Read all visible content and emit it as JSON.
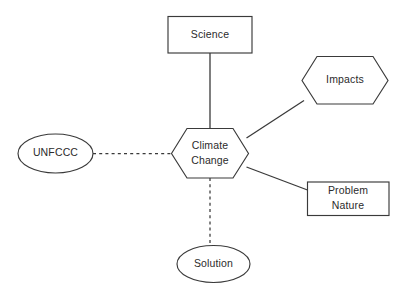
{
  "diagram": {
    "background_color": "#ffffff",
    "stroke_color": "#3a3a3a",
    "text_color": "#2b2b2b",
    "center": {
      "id": "climate-change",
      "shape": "hexagon",
      "label_line1": "Climate",
      "label_line2": "Change"
    },
    "nodes": [
      {
        "id": "science",
        "shape": "rectangle",
        "label": "Science",
        "position": "top"
      },
      {
        "id": "impacts",
        "shape": "hexagon",
        "label": "Impacts",
        "position": "top-right"
      },
      {
        "id": "problem-nature",
        "shape": "rectangle",
        "label_line1": "Problem",
        "label_line2": "Nature",
        "position": "bottom-right"
      },
      {
        "id": "unfccc",
        "shape": "ellipse",
        "label": "UNFCCC",
        "position": "left"
      },
      {
        "id": "solution",
        "shape": "ellipse",
        "label": "Solution",
        "position": "bottom"
      }
    ],
    "edges": [
      {
        "id": "edge-science",
        "from": "science",
        "to": "climate-change",
        "style": "solid"
      },
      {
        "id": "edge-impacts",
        "from": "climate-change",
        "to": "impacts",
        "style": "solid"
      },
      {
        "id": "edge-problem-nature",
        "from": "climate-change",
        "to": "problem-nature",
        "style": "solid"
      },
      {
        "id": "edge-unfccc",
        "from": "unfccc",
        "to": "climate-change",
        "style": "dashed"
      },
      {
        "id": "edge-solution",
        "from": "climate-change",
        "to": "solution",
        "style": "dashed"
      }
    ]
  }
}
